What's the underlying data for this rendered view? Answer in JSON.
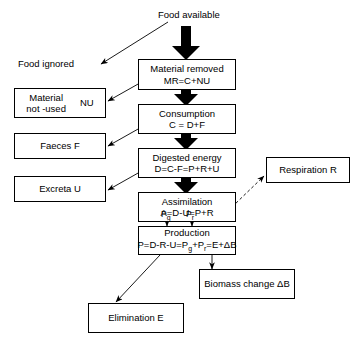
{
  "diagram": {
    "line_color": "#000000",
    "box_fill": "#ffffff",
    "thick_arrow_color": "#000000"
  },
  "labels": {
    "food_available": "Food available",
    "food_ignored": "Food ignored"
  },
  "boxes": {
    "material_not_used": {
      "line1": "Material",
      "line2": "not -used",
      "symbol": "NU"
    },
    "material_removed": {
      "line1": "Material removed",
      "line2": "MR=C+NU"
    },
    "consumption": {
      "line1": "Consumption",
      "line2": "C = D+F"
    },
    "faeces": {
      "line1": "Faeces   F"
    },
    "digested_energy": {
      "line1": "Digested energy",
      "line2": "D=C-F=P+R+U"
    },
    "excreta": {
      "line1": "Excreta  U"
    },
    "assimilation": {
      "line1": "Assimilation",
      "line2": "A=D-U=P+R"
    },
    "respiration": {
      "line1": "Respiration R"
    },
    "production": {
      "line1": "Production",
      "line2_pre": "P=D-R-U=P",
      "line2_sub1": "g",
      "line2_mid": "+P",
      "line2_sub2": "r",
      "line2_post": "=E+ΔB"
    },
    "biomass_change": {
      "line1": "Biomass change ΔB"
    },
    "elimination": {
      "line1": "Elimination E"
    }
  },
  "flow_labels": {
    "pg": "P",
    "pg_sub": "g",
    "pr": "P",
    "pr_sub": "r"
  },
  "edges": [
    {
      "from": "food_available",
      "to": "material_removed",
      "style": "thick-solid"
    },
    {
      "from": "food_available",
      "to": "food_ignored",
      "style": "thin-solid"
    },
    {
      "from": "material_removed",
      "to": "material_not_used",
      "style": "thin-solid"
    },
    {
      "from": "material_removed",
      "to": "consumption",
      "style": "thick-solid"
    },
    {
      "from": "consumption",
      "to": "faeces",
      "style": "thin-solid"
    },
    {
      "from": "consumption",
      "to": "digested_energy",
      "style": "thick-solid"
    },
    {
      "from": "digested_energy",
      "to": "excreta",
      "style": "thin-solid"
    },
    {
      "from": "digested_energy",
      "to": "assimilation",
      "style": "thick-solid"
    },
    {
      "from": "assimilation",
      "to": "respiration",
      "style": "dashed"
    },
    {
      "from": "assimilation",
      "to": "production",
      "style": "thin-solid-double"
    },
    {
      "from": "production",
      "to": "elimination",
      "style": "thin-solid"
    },
    {
      "from": "production",
      "to": "biomass_change",
      "style": "thin-solid"
    }
  ]
}
